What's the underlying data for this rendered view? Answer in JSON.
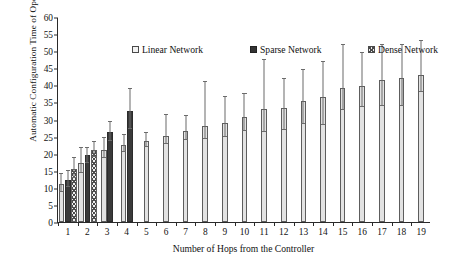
{
  "chart_data": {
    "type": "bar",
    "title": "",
    "xlabel": "Number of Hops from the Controller",
    "ylabel": "Automatic Configuration Time of OpenFlow (sec)",
    "categories": [
      "1",
      "2",
      "3",
      "4",
      "5",
      "6",
      "7",
      "8",
      "9",
      "10",
      "11",
      "12",
      "13",
      "14",
      "15",
      "16",
      "17",
      "18",
      "19"
    ],
    "ylim": [
      0,
      60
    ],
    "yticks": [
      0,
      5,
      10,
      15,
      20,
      25,
      30,
      35,
      40,
      45,
      50,
      55,
      60
    ],
    "grid": false,
    "legend_position": "top-inside",
    "error_bars": "symmetric-whiskers",
    "series": [
      {
        "name": "Linear Network",
        "color": "#e2e2e2",
        "pattern": "solid-light",
        "values": [
          11.1,
          17.4,
          21.2,
          22.6,
          23.7,
          25.2,
          26.6,
          28.2,
          28.9,
          30.8,
          33.0,
          33.5,
          35.3,
          36.6,
          39.2,
          39.7,
          41.5,
          42.1,
          43.0
        ],
        "err_upper": [
          3.0,
          4.3,
          3.4,
          2.9,
          2.3,
          6.1,
          4.3,
          12.7,
          7.6,
          6.8,
          14.4,
          8.3,
          9.1,
          10.3,
          12.7,
          9.9,
          10.4,
          9.7,
          9.9
        ],
        "err_lower": [
          2.4,
          3.2,
          2.6,
          2.0,
          1.7,
          2.4,
          2.7,
          3.9,
          4.0,
          4.3,
          6.7,
          6.5,
          6.7,
          8.2,
          6.4,
          6.0,
          7.6,
          8.2,
          5.0
        ]
      },
      {
        "name": "Sparse Network",
        "color": "#3a3a3a",
        "pattern": "solid-dark",
        "values": [
          12.4,
          19.5,
          26.3,
          32.4,
          null,
          null,
          null,
          null,
          null,
          null,
          null,
          null,
          null,
          null,
          null,
          null,
          null,
          null,
          null
        ],
        "err_upper": [
          2.4,
          2.3,
          3.1,
          6.4,
          null,
          null,
          null,
          null,
          null,
          null,
          null,
          null,
          null,
          null,
          null,
          null,
          null,
          null,
          null
        ],
        "err_lower": [
          2.1,
          2.1,
          2.6,
          5.1,
          null,
          null,
          null,
          null,
          null,
          null,
          null,
          null,
          null,
          null,
          null,
          null,
          null,
          null,
          null
        ]
      },
      {
        "name": "Dense Network",
        "color": "#ededed",
        "pattern": "cross-hatch",
        "values": [
          15.6,
          21.1,
          null,
          null,
          null,
          null,
          null,
          null,
          null,
          null,
          null,
          null,
          null,
          null,
          null,
          null,
          null,
          null,
          null
        ],
        "err_upper": [
          3.1,
          2.3,
          null,
          null,
          null,
          null,
          null,
          null,
          null,
          null,
          null,
          null,
          null,
          null,
          null,
          null,
          null,
          null,
          null
        ],
        "err_lower": [
          2.7,
          2.2,
          null,
          null,
          null,
          null,
          null,
          null,
          null,
          null,
          null,
          null,
          null,
          null,
          null,
          null,
          null,
          null,
          null
        ]
      }
    ]
  }
}
